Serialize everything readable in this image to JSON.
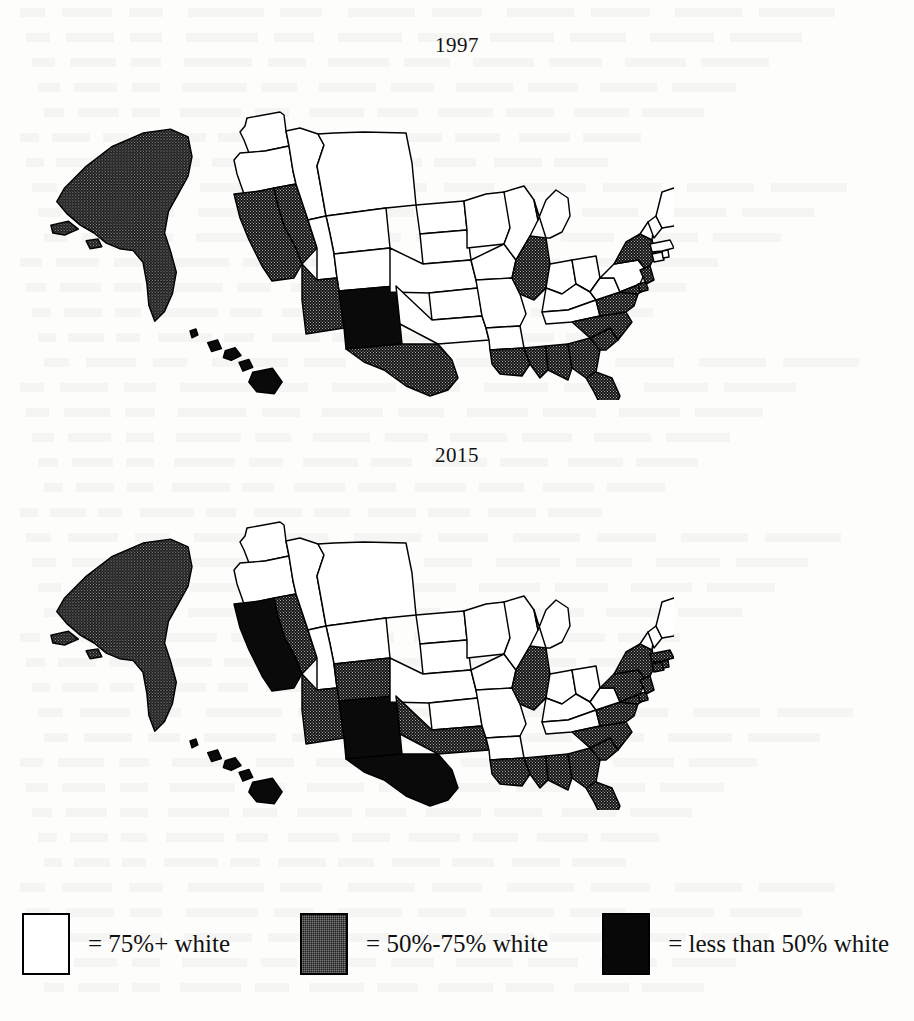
{
  "figure": {
    "background_color": "#fdfdfc",
    "ink_color": "#000000"
  },
  "maps": [
    {
      "id": "map-1997",
      "title": "1997"
    },
    {
      "id": "map-2015",
      "title": "2015"
    }
  ],
  "legend": {
    "items": [
      {
        "key": "white",
        "swatch_color": "#ffffff",
        "label": "= 75%+ white"
      },
      {
        "key": "gray",
        "swatch_color": "#1d1d1d",
        "label": "= 50%-75% white"
      },
      {
        "key": "black",
        "swatch_color": "#080808",
        "label": "= less than 50% white"
      }
    ]
  },
  "chart_data": {
    "type": "map",
    "panels": [
      "1997",
      "2015"
    ],
    "categories": [
      "75%+ white",
      "50%-75% white",
      "less than 50% white"
    ],
    "category_colors": [
      "#ffffff",
      "#1d1d1d",
      "#080808"
    ],
    "legend_position": "bottom",
    "series": [
      {
        "name": "1997",
        "values": {
          "AL": "50%-75% white",
          "AK": "50%-75% white",
          "AZ": "50%-75% white",
          "AR": "75%+ white",
          "CA": "50%-75% white",
          "CO": "75%+ white",
          "CT": "75%+ white",
          "DE": "50%-75% white",
          "FL": "50%-75% white",
          "GA": "50%-75% white",
          "HI": "less than 50% white",
          "ID": "75%+ white",
          "IL": "50%-75% white",
          "IN": "75%+ white",
          "IA": "75%+ white",
          "KS": "75%+ white",
          "KY": "75%+ white",
          "LA": "50%-75% white",
          "ME": "75%+ white",
          "MD": "50%-75% white",
          "MA": "75%+ white",
          "MI": "75%+ white",
          "MN": "75%+ white",
          "MS": "50%-75% white",
          "MO": "75%+ white",
          "MT": "75%+ white",
          "NE": "75%+ white",
          "NV": "50%-75% white",
          "NH": "75%+ white",
          "NJ": "50%-75% white",
          "NM": "less than 50% white",
          "NY": "50%-75% white",
          "NC": "50%-75% white",
          "ND": "75%+ white",
          "OH": "75%+ white",
          "OK": "75%+ white",
          "OR": "75%+ white",
          "PA": "75%+ white",
          "RI": "75%+ white",
          "SC": "50%-75% white",
          "SD": "75%+ white",
          "TN": "75%+ white",
          "TX": "50%-75% white",
          "UT": "75%+ white",
          "VT": "75%+ white",
          "VA": "50%-75% white",
          "WA": "75%+ white",
          "WV": "75%+ white",
          "WI": "75%+ white",
          "WY": "75%+ white"
        }
      },
      {
        "name": "2015",
        "values": {
          "AL": "50%-75% white",
          "AK": "50%-75% white",
          "AZ": "50%-75% white",
          "AR": "75%+ white",
          "CA": "less than 50% white",
          "CO": "50%-75% white",
          "CT": "50%-75% white",
          "DE": "50%-75% white",
          "FL": "50%-75% white",
          "GA": "50%-75% white",
          "HI": "less than 50% white",
          "ID": "75%+ white",
          "IL": "50%-75% white",
          "IN": "75%+ white",
          "IA": "75%+ white",
          "KS": "75%+ white",
          "KY": "75%+ white",
          "LA": "50%-75% white",
          "ME": "75%+ white",
          "MD": "50%-75% white",
          "MA": "50%-75% white",
          "MI": "75%+ white",
          "MN": "75%+ white",
          "MS": "50%-75% white",
          "MO": "75%+ white",
          "MT": "75%+ white",
          "NE": "75%+ white",
          "NV": "50%-75% white",
          "NH": "75%+ white",
          "NJ": "50%-75% white",
          "NM": "less than 50% white",
          "NY": "50%-75% white",
          "NC": "50%-75% white",
          "ND": "75%+ white",
          "OH": "75%+ white",
          "OK": "50%-75% white",
          "OR": "75%+ white",
          "PA": "50%-75% white",
          "RI": "50%-75% white",
          "SC": "50%-75% white",
          "SD": "75%+ white",
          "TN": "75%+ white",
          "TX": "less than 50% white",
          "UT": "75%+ white",
          "VT": "75%+ white",
          "VA": "50%-75% white",
          "WA": "75%+ white",
          "WV": "75%+ white",
          "WI": "75%+ white",
          "WY": "75%+ white"
        }
      }
    ]
  }
}
